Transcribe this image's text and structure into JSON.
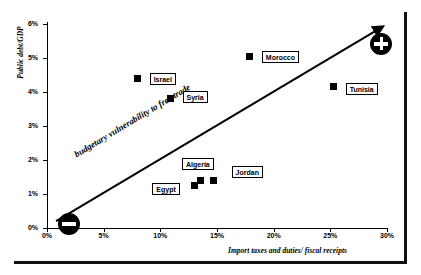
{
  "chart_data": {
    "type": "scatter",
    "title": "",
    "xlabel": "Import taxes and duties/ fiscal receipts",
    "ylabel": "Public debt/GDP",
    "xlim": [
      0,
      30
    ],
    "ylim": [
      0,
      6
    ],
    "xtick_labels": [
      "0%",
      "5%",
      "10%",
      "15%",
      "20%",
      "25%",
      "30%"
    ],
    "xtick_values": [
      0,
      5,
      10,
      15,
      20,
      25,
      30
    ],
    "ytick_labels": [
      "0%",
      "1%",
      "2%",
      "3%",
      "4%",
      "5%",
      "6%"
    ],
    "ytick_values": [
      0,
      1,
      2,
      3,
      4,
      5,
      6
    ],
    "grid": false,
    "legend": "none",
    "points": [
      {
        "label": "Israel",
        "x": 8.0,
        "y": 4.4,
        "label_dx": 12,
        "label_dy": -5
      },
      {
        "label": "Syria",
        "x": 10.9,
        "y": 3.8,
        "label_dx": 12,
        "label_dy": -8
      },
      {
        "label": "Morocco",
        "x": 17.9,
        "y": 5.05,
        "label_dx": 12,
        "label_dy": -5
      },
      {
        "label": "Tunisia",
        "x": 25.3,
        "y": 4.15,
        "label_dx": 12,
        "label_dy": -4
      },
      {
        "label": "Egypt",
        "x": 13.0,
        "y": 1.25,
        "label_dx": -42,
        "label_dy": -3
      },
      {
        "label": "Algeria",
        "x": 13.5,
        "y": 1.4,
        "label_dx": -18,
        "label_dy": -22
      },
      {
        "label": "Jordan",
        "x": 14.7,
        "y": 1.4,
        "label_dx": 18,
        "label_dy": -14
      }
    ],
    "annotations": [
      {
        "name": "trend-label",
        "text": "budgetary vulnerability to free trade",
        "rotation_deg": -31
      },
      {
        "name": "low-end-badge",
        "symbol": "−"
      },
      {
        "name": "high-end-badge",
        "symbol": "+"
      }
    ],
    "trend_line": {
      "from": [
        0.8,
        0.2
      ],
      "to": [
        29.0,
        5.8
      ],
      "arrow": true
    }
  },
  "colors": {
    "foreground": "#000000",
    "background": "#ffffff",
    "marker": "#000000",
    "frame": "#111111"
  }
}
